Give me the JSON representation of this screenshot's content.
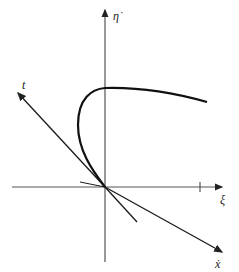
{
  "diagram": {
    "type": "phase-plane sketch",
    "labels": {
      "vertical_axis": "η̇",
      "horizontal_axis": "ξ",
      "upper_left_line": "t",
      "lower_right_line": "ẋ"
    },
    "colors": {
      "ink": "#1a1a1a",
      "axis": "#555555",
      "background": "#ffffff"
    }
  }
}
